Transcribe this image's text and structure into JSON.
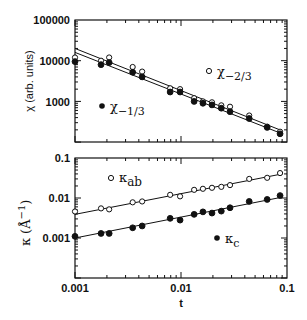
{
  "chart_data": [
    {
      "type": "scatter",
      "panel": "top",
      "xscale": "log",
      "yscale": "log",
      "xlabel": "t",
      "ylabel": "χ (arb. units)",
      "xlim": [
        0.001,
        0.1
      ],
      "ylim": [
        100,
        100000
      ],
      "yticks": [
        "100000",
        "10000",
        "1000"
      ],
      "series": [
        {
          "name": "χ-2/3",
          "marker": "open-circle",
          "x": [
            0.001,
            0.00176,
            0.0021,
            0.0035,
            0.0043,
            0.0079,
            0.0098,
            0.0133,
            0.0161,
            0.0196,
            0.024,
            0.029,
            0.044,
            0.065,
            0.086
          ],
          "y": [
            12000,
            10000,
            12000,
            7000,
            5400,
            2100,
            2000,
            1200,
            1000,
            950,
            800,
            740,
            450,
            240,
            180
          ]
        },
        {
          "name": "χ-1/3",
          "marker": "filled-circle",
          "x": [
            0.001,
            0.00176,
            0.0021,
            0.0035,
            0.0043,
            0.0079,
            0.0098,
            0.0133,
            0.0161,
            0.0196,
            0.024,
            0.029,
            0.044,
            0.065,
            0.086
          ],
          "y": [
            9500,
            8000,
            9000,
            5200,
            4000,
            1700,
            1700,
            1000,
            900,
            820,
            680,
            560,
            380,
            230,
            160
          ]
        }
      ],
      "fit_lines": [
        {
          "name": "fit χ-2/3",
          "x": [
            0.001,
            0.09
          ],
          "y": [
            20000,
            190
          ]
        },
        {
          "name": "fit χ-1/3",
          "x": [
            0.001,
            0.09
          ],
          "y": [
            16000,
            160
          ]
        }
      ],
      "legend": [
        {
          "label": "χ",
          "sub": "-2/3",
          "marker": "open-circle"
        },
        {
          "label": "χ",
          "sub": "-1/3",
          "marker": "filled-circle"
        }
      ]
    },
    {
      "type": "scatter",
      "panel": "bottom",
      "xscale": "log",
      "yscale": "log",
      "xlabel": "t",
      "ylabel": "κ (Å⁻¹)",
      "xlim": [
        0.001,
        0.1
      ],
      "ylim": [
        0.0001,
        0.1
      ],
      "xticks": [
        "0.001",
        "0.01",
        "0.1"
      ],
      "yticks": [
        "0.1",
        "0.01",
        "0.001"
      ],
      "series": [
        {
          "name": "κab",
          "marker": "open-circle",
          "x": [
            0.001,
            0.00176,
            0.0021,
            0.0035,
            0.0043,
            0.0079,
            0.0098,
            0.0133,
            0.0161,
            0.0196,
            0.024,
            0.029,
            0.044,
            0.065,
            0.086
          ],
          "y": [
            0.0046,
            0.0055,
            0.0052,
            0.0078,
            0.0082,
            0.012,
            0.011,
            0.016,
            0.017,
            0.018,
            0.019,
            0.021,
            0.03,
            0.032,
            0.042
          ]
        },
        {
          "name": "κc",
          "marker": "filled-circle",
          "x": [
            0.001,
            0.00176,
            0.0021,
            0.0035,
            0.0043,
            0.0079,
            0.0098,
            0.0133,
            0.0161,
            0.0196,
            0.024,
            0.029,
            0.044,
            0.065,
            0.086
          ],
          "y": [
            0.0011,
            0.0013,
            0.0013,
            0.0018,
            0.002,
            0.0031,
            0.0028,
            0.0039,
            0.0045,
            0.0042,
            0.0047,
            0.0057,
            0.0082,
            0.0092,
            0.0115
          ]
        }
      ],
      "fit_lines": [
        {
          "name": "fit κab",
          "x": [
            0.001,
            0.09
          ],
          "y": [
            0.0039,
            0.04
          ]
        },
        {
          "name": "fit κc",
          "x": [
            0.001,
            0.09
          ],
          "y": [
            0.001,
            0.0105
          ]
        }
      ],
      "legend": [
        {
          "label": "κ",
          "sub": "ab",
          "marker": "open-circle"
        },
        {
          "label": "κ",
          "sub": "c",
          "marker": "filled-circle"
        }
      ]
    }
  ],
  "labels": {
    "top_ylabel": "χ (arb. units)",
    "bottom_ylabel_main": "κ",
    "bottom_ylabel_unit": "(Å",
    "bottom_ylabel_exp": "−1",
    "bottom_ylabel_close": ")",
    "xlabel": "t",
    "legend_chi_23": "χ",
    "legend_chi_23_sub": "−2/3",
    "legend_chi_13": "χ",
    "legend_chi_13_sub": "−1/3",
    "legend_kab": "κ",
    "legend_kab_sub": "ab",
    "legend_kc": "κ",
    "legend_kc_sub": "c"
  },
  "ticks": {
    "top_y": [
      "100000",
      "10000",
      "1000"
    ],
    "bottom_y": [
      "0.1",
      "0.01",
      "0.001"
    ],
    "x": [
      "0.001",
      "0.01",
      "0.1"
    ]
  }
}
